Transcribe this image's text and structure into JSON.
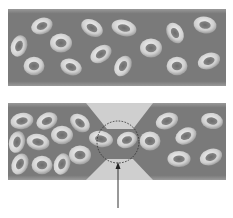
{
  "diagram": {
    "colors": {
      "background": "#ffffff",
      "vessel_fill": "#7c7c7c",
      "vessel_edge": "#959595",
      "cell_rim_light": "#e6e6e6",
      "cell_rim_dark": "#a9a9a9",
      "cell_center": "#767676",
      "constriction_fill": "#cfcfcf",
      "highlight_circle": "#333333",
      "arrow": "#333333"
    },
    "panels": [
      {
        "name": "normal-vessel",
        "description": "Unobstructed vessel with freely dispersed red blood cells",
        "cell_count": 15
      },
      {
        "name": "constricted-vessel",
        "description": "Vessel with a narrowed section causing cells to pile up upstream",
        "cell_count": 19,
        "annotation": "dashed circle highlighting narrowed passage, arrow pointing up to it"
      }
    ],
    "caption": ""
  }
}
